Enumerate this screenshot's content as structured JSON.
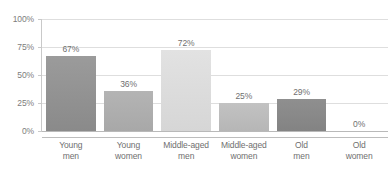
{
  "chart_data": {
    "type": "bar",
    "title": "",
    "subtitle": "",
    "xlabel": "",
    "ylabel": "",
    "ylim": [
      0,
      100
    ],
    "grid": true,
    "legend": false,
    "legend_position": "none",
    "categories": [
      "Young men",
      "Young women",
      "Middle-aged men",
      "Middle-aged women",
      "Old men",
      "Old women"
    ],
    "category_lines": [
      [
        "Young",
        "men"
      ],
      [
        "Young",
        "women"
      ],
      [
        "Middle-aged",
        "men"
      ],
      [
        "Middle-aged",
        "women"
      ],
      [
        "Old",
        "men"
      ],
      [
        "Old",
        "women"
      ]
    ],
    "values": [
      67,
      36,
      72,
      25,
      29,
      0
    ],
    "value_labels": [
      "67%",
      "36%",
      "72%",
      "25%",
      "29%",
      "0%"
    ],
    "y_ticks": [
      0,
      25,
      50,
      75,
      100
    ],
    "y_tick_labels": [
      "0%",
      "25%",
      "50%",
      "75%",
      "100%"
    ],
    "bar_colors": [
      "#9b9b9b",
      "#b4b4b4",
      "#e2e2e2",
      "#c2c2c2",
      "#8f8f8f",
      "#ffffff"
    ],
    "bar_colors_bottom": [
      "#8a8a8a",
      "#a8a8a8",
      "#d6d6d6",
      "#b6b6b6",
      "#838383",
      "#ffffff"
    ],
    "axis_color": "#bdbdbd",
    "grid_color": "#dedede",
    "text_color": "#6f6f6f"
  }
}
